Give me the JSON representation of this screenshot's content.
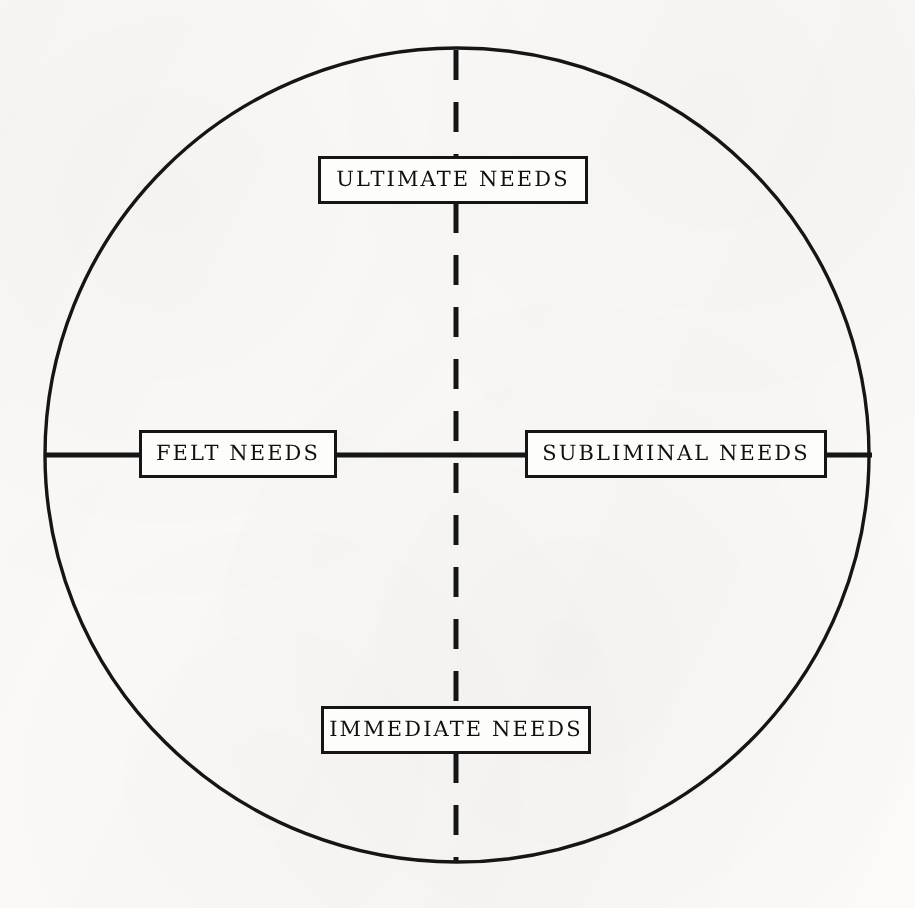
{
  "figure": {
    "shape": "circle",
    "ink_color": "#151515",
    "paper_color": "#fbfaf8"
  },
  "axes": {
    "horizontal": {
      "name": "horizontal-divider",
      "style": "solid",
      "left_label": "FELT NEEDS",
      "right_label": "SUBLIMINAL NEEDS"
    },
    "vertical": {
      "name": "vertical-divider",
      "style": "dashed",
      "top_label": "ULTIMATE NEEDS",
      "bottom_label": "IMMEDIATE NEEDS"
    }
  },
  "nodes": [
    {
      "id": "ultimate",
      "label": "ULTIMATE NEEDS",
      "position": "top"
    },
    {
      "id": "felt",
      "label": "FELT NEEDS",
      "position": "left"
    },
    {
      "id": "subliminal",
      "label": "SUBLIMINAL NEEDS",
      "position": "right"
    },
    {
      "id": "immediate",
      "label": "IMMEDIATE NEEDS",
      "position": "bottom"
    }
  ]
}
